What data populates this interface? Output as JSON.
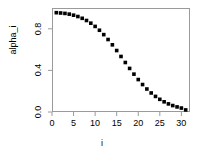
{
  "chart_data": {
    "type": "scatter",
    "title": "",
    "subtitle": "",
    "xlabel": "i",
    "ylabel": "alpha_i",
    "xlim": [
      0,
      32
    ],
    "ylim": [
      0.0,
      1.0
    ],
    "xticks": [
      0,
      5,
      10,
      15,
      20,
      25,
      30
    ],
    "xticklabels": [
      "0",
      "5",
      "10",
      "15",
      "20",
      "25",
      "30"
    ],
    "yticks": [
      0.0,
      0.4,
      0.8
    ],
    "yticklabels": [
      "0.0",
      "0.4",
      "0.8"
    ],
    "grid": false,
    "legend": null,
    "marker": "filled-square",
    "marker_color": "#000000",
    "frame_color": "#9a9a9a",
    "series": [
      {
        "name": "alpha_i",
        "x": [
          1,
          2,
          3,
          4,
          5,
          6,
          7,
          8,
          9,
          10,
          11,
          12,
          13,
          14,
          15,
          16,
          17,
          18,
          19,
          20,
          21,
          22,
          23,
          24,
          25,
          26,
          27,
          28,
          29,
          30,
          31
        ],
        "values": [
          0.955,
          0.952,
          0.948,
          0.941,
          0.931,
          0.918,
          0.901,
          0.88,
          0.854,
          0.823,
          0.786,
          0.744,
          0.697,
          0.646,
          0.591,
          0.534,
          0.476,
          0.419,
          0.364,
          0.312,
          0.264,
          0.221,
          0.183,
          0.15,
          0.122,
          0.098,
          0.078,
          0.062,
          0.049,
          0.038,
          0.02
        ]
      }
    ]
  }
}
